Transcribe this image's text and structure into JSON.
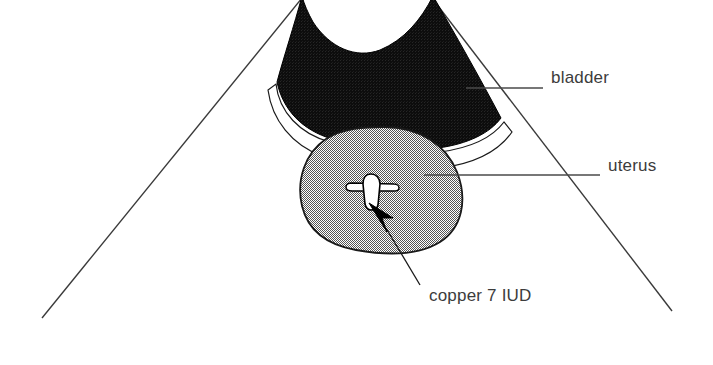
{
  "figure": {
    "background_color": "#ffffff",
    "width": 713,
    "height": 365
  },
  "labels": {
    "bladder": "bladder",
    "uterus": "uterus",
    "iud": "copper 7 IUD"
  },
  "structures": {
    "bladder": {
      "name": "bladder",
      "fill_color": "#111111",
      "stroke_color": "#000000",
      "description": "solid black saddle-shaped region with concave superior border"
    },
    "uterus": {
      "name": "uterus",
      "fill_color": "#a8a8a8",
      "stroke_color": "#1a1a1a",
      "description": "gray stippled rounded oval inferior to bladder"
    },
    "iud": {
      "name": "copper 7 IUD",
      "fill_color": "#ffffff",
      "stroke_color": "#000000",
      "description": "small white cone with horizontal transverse arm inside uterine cavity"
    },
    "scan_cone": {
      "name": "ultrasound scan sector",
      "stroke_color": "#3a3a3a",
      "description": "two diverging straight lines forming the sector beam edges"
    }
  },
  "annotations": {
    "bladder_leader": {
      "type": "line",
      "color": "#4a4a4a"
    },
    "uterus_leader": {
      "type": "line",
      "color": "#4a4a4a"
    },
    "iud_pointer": {
      "type": "arrow",
      "color": "#000000"
    }
  },
  "colors": {
    "ink": "#000000",
    "text": "#3c3c3c",
    "leader": "#4a4a4a",
    "gray_fill": "#a8a8a8",
    "black_fill": "#111111",
    "white": "#ffffff"
  }
}
